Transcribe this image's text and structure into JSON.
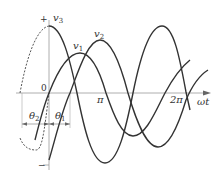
{
  "diagram": {
    "type": "three-phase-sinusoids",
    "axis": {
      "x_label": "ωt",
      "origin_label": "0",
      "ticks": [
        "π",
        "2π"
      ],
      "y_plus": "+",
      "y_minus": "−"
    },
    "curves": [
      {
        "name": "v3",
        "label": "v",
        "sub": "3",
        "style": "solid with dashed extension before origin"
      },
      {
        "name": "v1",
        "label": "v",
        "sub": "1",
        "style": "solid"
      },
      {
        "name": "v2",
        "label": "v",
        "sub": "2",
        "style": "solid"
      }
    ],
    "angles": [
      {
        "label": "θ",
        "sub": "2"
      },
      {
        "label": "θ",
        "sub": "1"
      }
    ],
    "colors": {
      "curve": "#333333",
      "axis": "#999999",
      "background": "#ffffff"
    }
  }
}
